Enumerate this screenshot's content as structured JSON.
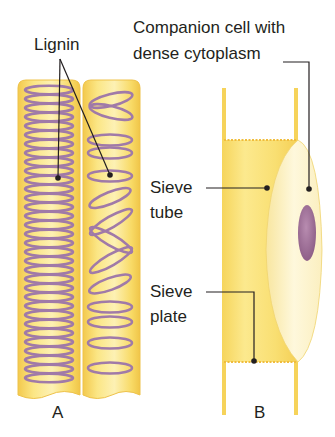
{
  "figure": {
    "panels": [
      {
        "id": "A",
        "label": "A",
        "description": "Xylem vessels with lignin thickenings"
      },
      {
        "id": "B",
        "label": "B",
        "description": "Phloem sieve tube with companion cell"
      }
    ],
    "labels": {
      "lignin": "Lignin",
      "companion_line1": "Companion cell with",
      "companion_line2": "dense cytoplasm",
      "sieve_tube_line1": "Sieve",
      "sieve_tube_line2": "tube",
      "sieve_plate_line1": "Sieve",
      "sieve_plate_line2": "plate",
      "panel_a": "A",
      "panel_b": "B"
    },
    "colors": {
      "tube_fill": "#f8dc6a",
      "tube_light": "#fdf0b0",
      "tube_edge": "#f0c850",
      "lignin": "#a07aa8",
      "nucleus": "#9e6f98",
      "companion_fill": "#fdf3c8",
      "leader_line": "#231f20"
    }
  }
}
